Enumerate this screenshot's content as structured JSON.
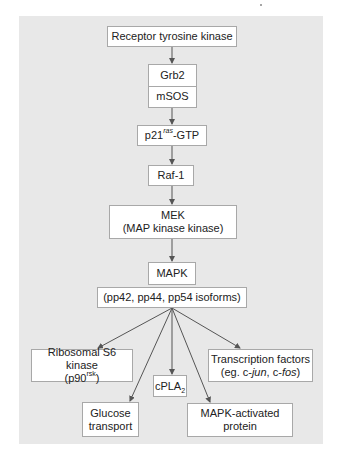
{
  "diagram": {
    "colors": {
      "panel_bg": "#e8e8e8",
      "box_fill": "#ffffff",
      "box_border": "#a8a8a8",
      "arrow": "#555555",
      "text": "#222222"
    },
    "nodes": {
      "receptor": {
        "label": "Receptor tyrosine kinase"
      },
      "grb2": {
        "label": "Grb2"
      },
      "msos": {
        "label": "mSOS"
      },
      "p21": {
        "label_main": "p21",
        "label_sup": "ras",
        "label_tail": "-GTP"
      },
      "raf1": {
        "label": "Raf-1"
      },
      "mek": {
        "line1": "MEK",
        "line2": "(MAP kinase kinase)"
      },
      "mapk": {
        "label": "MAPK"
      },
      "isoforms": {
        "label": "(pp42, pp44, pp54 isoforms)"
      },
      "rsk": {
        "line1": "Ribosomal S6 kinase",
        "line2_open": "(p90",
        "line2_sup": "rsk",
        "line2_close": ")"
      },
      "glucose": {
        "line1": "Glucose",
        "line2": "transport"
      },
      "cpla2": {
        "label_main": "cPLA",
        "label_sub": "2"
      },
      "mapkap": {
        "line1": "MAPK-activated",
        "line2": "protein"
      },
      "tf": {
        "line1": "Transcription factors",
        "line2_pre": "(eg. c-",
        "line2_i1": "jun",
        "line2_mid": ", c-",
        "line2_i2": "fos",
        "line2_post": ")"
      }
    },
    "edges": [
      {
        "from": "Receptor tyrosine kinase",
        "to": "Grb2/mSOS"
      },
      {
        "from": "Grb2/mSOS",
        "to": "p21ras-GTP"
      },
      {
        "from": "p21ras-GTP",
        "to": "Raf-1"
      },
      {
        "from": "Raf-1",
        "to": "MEK"
      },
      {
        "from": "MEK",
        "to": "MAPK"
      },
      {
        "from": "MAPK",
        "to": "Ribosomal S6 kinase"
      },
      {
        "from": "MAPK",
        "to": "Glucose transport"
      },
      {
        "from": "MAPK",
        "to": "cPLA2"
      },
      {
        "from": "MAPK",
        "to": "MAPK-activated protein"
      },
      {
        "from": "MAPK",
        "to": "Transcription factors"
      }
    ]
  }
}
